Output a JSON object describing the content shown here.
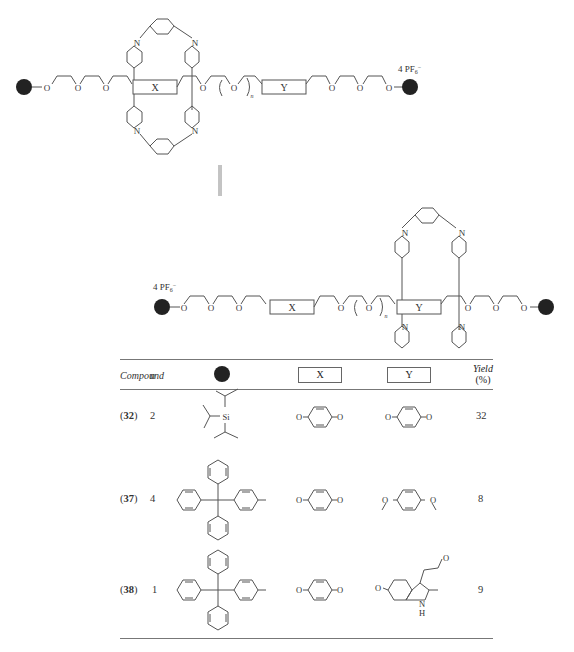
{
  "figure": {
    "top_structure": {
      "counterion": "4 PF6−",
      "counterion_parts": {
        "prefix": "4 PF",
        "sub": "6",
        "sup": "−"
      },
      "box_x_label": "X",
      "box_y_label": "Y",
      "repeat_subscript": "n",
      "ring_atom_label": "N",
      "ring_charge": "+",
      "oxygen_label": "O",
      "macrocycle_position": "around X"
    },
    "equilibrium_arrow": "⇌",
    "bottom_structure": {
      "counterion_parts": {
        "prefix": "4 PF",
        "sub": "6",
        "sup": "−"
      },
      "box_x_label": "X",
      "box_y_label": "Y",
      "repeat_subscript": "n",
      "macrocycle_position": "around Y"
    }
  },
  "table": {
    "headers": {
      "compound": "Compound",
      "n": "n",
      "stopper": "●",
      "x": "X",
      "y": "Y",
      "yield_line1": "Yield",
      "yield_line2": "(%)"
    },
    "rows": [
      {
        "compound_open": "(",
        "compound": "32",
        "compound_close": ")",
        "n": "2",
        "stopper": "triisopropylsilyl (Si)",
        "x": "1,4-dioxybenzene",
        "y": "1,4-dioxybenzene",
        "yield": "32"
      },
      {
        "compound_open": "(",
        "compound": "37",
        "compound_close": ")",
        "n": "4",
        "stopper": "tetraarylmethane (trityl-phenyl)",
        "x": "1,4-dioxybenzene",
        "y": "1,4-dimethoxy-linked benzene",
        "yield": "8"
      },
      {
        "compound_open": "(",
        "compound": "38",
        "compound_close": ")",
        "n": "1",
        "stopper": "tetraarylmethane (trityl-phenyl)",
        "x": "1,4-dioxybenzene",
        "y": "2-methyl-indole (5-O, 3-ethyl-O, NH)",
        "yield": "9"
      }
    ],
    "atom_labels": {
      "si": "Si",
      "o": "O",
      "n": "N",
      "h": "H"
    }
  }
}
